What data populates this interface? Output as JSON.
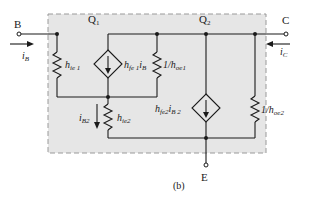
{
  "diagram": {
    "caption": "(b)",
    "box_fill": "#e6e6e6",
    "wire_color": "#1a1a1a",
    "terminals": {
      "base": "B",
      "collector": "C",
      "emitter": "E"
    },
    "currents": {
      "base_current": "i",
      "base_current_sub": "B",
      "collector_current": "i",
      "collector_current_sub": "C",
      "ib2": "i",
      "ib2_sub": "B2"
    },
    "transistors": {
      "q1": "Q",
      "q1_sub": "1",
      "q2": "Q",
      "q2_sub": "2"
    },
    "components": {
      "hie1": {
        "main": "h",
        "sub": "ie 1"
      },
      "hfe1": {
        "main": "h",
        "sub": "fe 1",
        "tail": "i",
        "tail_sub": "B"
      },
      "hoe1": {
        "prefix": "1/h",
        "sub": "oe1"
      },
      "hie2": {
        "main": "h",
        "sub": "ie2"
      },
      "hfe2": {
        "main": "h",
        "sub": "fe2",
        "tail": "i",
        "tail_sub": "B 2"
      },
      "hoe2": {
        "prefix": "1/h",
        "sub": "oe2"
      }
    }
  }
}
